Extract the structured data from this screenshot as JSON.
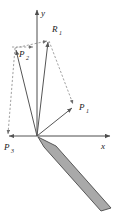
{
  "figure": {
    "background_color": "#ffffff",
    "width": 118,
    "height": 216
  },
  "axes": {
    "origin": {
      "x": 37,
      "y": 136
    },
    "x_axis": {
      "label": "x",
      "label_x": 101,
      "label_y": 148,
      "from_x": 37,
      "from_y": 136,
      "to_x": 112,
      "to_y": 136,
      "color": "#4d4d4d"
    },
    "y_axis": {
      "label": "y",
      "label_x": 41,
      "label_y": 14,
      "from_x": 37,
      "from_y": 136,
      "to_x": 37,
      "to_y": 8,
      "color": "#4d4d4d"
    }
  },
  "vectors": [
    {
      "name": "R1",
      "label": "R",
      "subscript": "1",
      "label_x": 53,
      "label_y": 32,
      "tip_x": 49,
      "tip_y": 40,
      "color": "#555555"
    },
    {
      "name": "P2",
      "label": "P",
      "subscript": "2",
      "label_x": 20,
      "label_y": 56,
      "tip_x": 15,
      "tip_y": 48,
      "color": "#555555"
    },
    {
      "name": "P1",
      "label": "P",
      "subscript": "1",
      "label_x": 80,
      "label_y": 109,
      "tip_x": 74,
      "tip_y": 106,
      "color": "#555555"
    },
    {
      "name": "P3",
      "label": "P",
      "subscript": "3",
      "label_x": 5,
      "label_y": 148,
      "tip_x": 7,
      "tip_y": 136,
      "color": "#555555"
    }
  ],
  "dashed_edges": [
    {
      "name": "p2-to-r1",
      "x1": 15,
      "y1": 48,
      "x2": 49,
      "y2": 40
    },
    {
      "name": "r1-to-p1",
      "x1": 49,
      "y1": 40,
      "x2": 74,
      "y2": 106
    },
    {
      "name": "p2-to-p3",
      "x1": 15,
      "y1": 48,
      "x2": 7,
      "y2": 136
    },
    {
      "name": "p2-horizontal-guide",
      "x1": 12,
      "y1": 47,
      "x2": 34,
      "y2": 47
    }
  ],
  "shaded_region": {
    "name": "shaded-plane-wedge",
    "fill_color": "#a9a9a9",
    "stroke_color": "#4a4a4a",
    "points": "38,137 44,147 101,211 111,208 56,146"
  },
  "colors": {
    "axis": "#4d4d4d",
    "vector": "#555555",
    "dashed": "#8a8a8a",
    "shade_fill": "#a9a9a9",
    "shade_stroke": "#4a4a4a",
    "text": "#1a1a1a"
  }
}
